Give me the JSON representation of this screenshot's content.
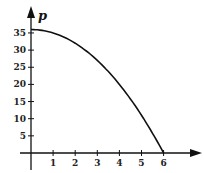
{
  "chart_data": {
    "type": "line",
    "title": "",
    "xlabel": "",
    "ylabel": "p",
    "xlim": [
      0,
      7
    ],
    "ylim": [
      0,
      38
    ],
    "grid": false,
    "legend": null,
    "x_ticks": [
      1,
      2,
      3,
      4,
      5,
      6
    ],
    "y_ticks": [
      5,
      10,
      15,
      20,
      25,
      30,
      35
    ],
    "series": [
      {
        "name": "p = 36 - t^2",
        "x": [
          0,
          0.5,
          1,
          1.5,
          2,
          2.5,
          3,
          3.5,
          4,
          4.5,
          5,
          5.5,
          6
        ],
        "values": [
          36,
          35.75,
          35,
          33.75,
          32,
          29.75,
          27,
          23.75,
          20,
          15.75,
          11,
          5.75,
          0
        ]
      }
    ]
  },
  "axes": {
    "y_label": "p",
    "x_tick_labels": [
      "1",
      "2",
      "3",
      "4",
      "5",
      "6"
    ],
    "y_tick_labels": [
      "5",
      "10",
      "15",
      "20",
      "25",
      "30",
      "35"
    ]
  }
}
